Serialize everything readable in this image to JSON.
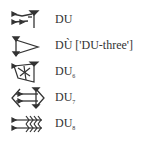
{
  "signs": [
    {
      "label": "DU",
      "sub": "",
      "icon": "cuneiform-du-icon"
    },
    {
      "label": "DÙ ['DU-three']",
      "sub": "",
      "icon": "cuneiform-du3-icon"
    },
    {
      "label": "DU",
      "sub": "6",
      "icon": "cuneiform-du6-icon"
    },
    {
      "label": "DU",
      "sub": "7",
      "icon": "cuneiform-du7-icon"
    },
    {
      "label": "DU",
      "sub": "8",
      "icon": "cuneiform-du8-icon"
    }
  ]
}
